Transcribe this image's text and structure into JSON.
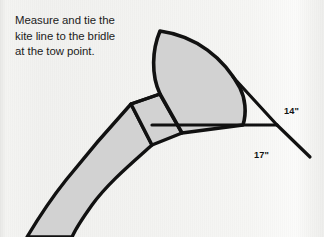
{
  "figure": {
    "type": "instructional-diagram",
    "background_color": "#f3f3f1",
    "sail_fill_color": "#d2d2d2",
    "line_color": "#111111",
    "text_color": "#1b1b1b"
  },
  "caption": {
    "text": "Measure and tie the\nkite line to the bridle\nat the tow point.",
    "lines": [
      "Measure and tie the",
      "kite line to the bridle",
      "at the tow point."
    ]
  },
  "dimensions": [
    {
      "id": "upper-bridle-leg",
      "label": "14\"",
      "value": 14,
      "unit": "inch"
    },
    {
      "id": "lower-bridle-leg",
      "label": "17\"",
      "value": 17,
      "unit": "inch"
    }
  ],
  "parts": [
    {
      "id": "sail",
      "name": "kite-sail"
    },
    {
      "id": "spar",
      "name": "cross-spar"
    },
    {
      "id": "tail",
      "name": "kite-tail-spine"
    },
    {
      "id": "bridle-upper",
      "name": "upper-bridle-line"
    },
    {
      "id": "bridle-lower",
      "name": "lower-bridle-line"
    },
    {
      "id": "bridle-horizontal",
      "name": "horizontal-bridle-line"
    },
    {
      "id": "tow-point",
      "name": "tow-point"
    },
    {
      "id": "kite-line",
      "name": "kite-line"
    }
  ]
}
